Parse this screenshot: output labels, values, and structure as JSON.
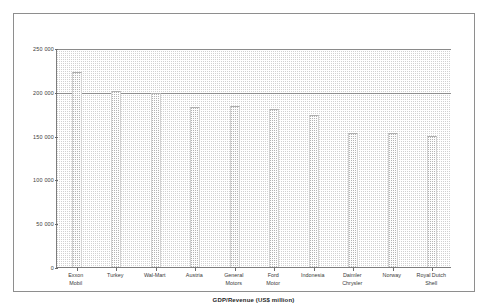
{
  "page": {
    "title": ""
  },
  "axis": {
    "x_title": "GDP/Revenue (US$ million)",
    "y_title": ""
  },
  "chart_data": {
    "type": "bar",
    "title": "",
    "subtitle": "",
    "xlabel": "GDP/Revenue (US$ million)",
    "ylabel": "",
    "grid": true,
    "legend": false,
    "orientation": "vertical",
    "ylim": [
      0,
      250000
    ],
    "ytick_labels": [
      "250 000",
      "200 000",
      "150 000",
      "100 000",
      "50 000",
      "0"
    ],
    "ytick_values": [
      250000,
      200000,
      150000,
      100000,
      50000,
      0
    ],
    "categories": [
      "Exxon Mobil",
      "Turkey",
      "Wal-Mart",
      "Austria",
      "General Motors",
      "Ford Motor",
      "Indonesia",
      "Daimler Chrysler",
      "Norway",
      "Royal Dutch Shell"
    ],
    "category_lines": [
      [
        "Exxon",
        "Mobil"
      ],
      [
        "Turkey",
        ""
      ],
      [
        "Wal-Mart",
        ""
      ],
      [
        "Austria",
        ""
      ],
      [
        "General",
        "Motors"
      ],
      [
        "Ford",
        "Motor"
      ],
      [
        "Indonesia",
        ""
      ],
      [
        "Daimler",
        "Chrysler"
      ],
      [
        "Norway",
        ""
      ],
      [
        "Royal Dutch",
        "Shell"
      ]
    ],
    "values": [
      223000,
      201000,
      199000,
      183000,
      184000,
      180000,
      173000,
      153000,
      153000,
      150000
    ]
  },
  "colors": {
    "frame": "#8e8e8e",
    "axis": "#7d7d7d",
    "gridline": "#6f6f6f",
    "bar_fill": "#fdfdfd",
    "bar_pattern": "#b4b4b4",
    "backdrop_pattern": "#c9c9c9",
    "text": "#3a3a3a",
    "title_text": "#1f1f1f",
    "background": "#ffffff"
  }
}
